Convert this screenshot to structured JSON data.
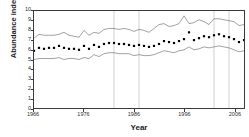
{
  "chart_data": {
    "type": "line",
    "title": "",
    "subtitle": "",
    "xlabel": "Year",
    "ylabel": "Abundance index",
    "xlim": [
      1966,
      2008
    ],
    "ylim": [
      0,
      10
    ],
    "grid": "vertical-only",
    "legend": "none",
    "xticks": [
      1966,
      1976,
      1986,
      1996,
      2006
    ],
    "xtick_labels": [
      "1966",
      "1976",
      "1986",
      "1996",
      "2006"
    ],
    "yticks": [
      0,
      1,
      2,
      3,
      4,
      5,
      6,
      7,
      8,
      9,
      10
    ],
    "ytick_labels": [
      "0",
      "1",
      "2",
      "3",
      "4",
      "5",
      "6",
      "7",
      "8",
      "9",
      "10"
    ],
    "gridline_years": [
      1982,
      1987,
      2002,
      2005
    ],
    "x": [
      1966,
      1967,
      1968,
      1969,
      1970,
      1971,
      1972,
      1973,
      1974,
      1975,
      1976,
      1977,
      1978,
      1979,
      1980,
      1981,
      1982,
      1983,
      1984,
      1985,
      1986,
      1987,
      1988,
      1989,
      1990,
      1991,
      1992,
      1993,
      1994,
      1995,
      1996,
      1997,
      1998,
      1999,
      2000,
      2001,
      2002,
      2003,
      2004,
      2005,
      2006,
      2007,
      2008
    ],
    "series": [
      {
        "name": "Abundance index",
        "style": "markers",
        "marker": "square",
        "color": "#000000",
        "values": [
          5.9,
          6.2,
          6.1,
          6.2,
          6.2,
          6.4,
          6.2,
          6.1,
          6.1,
          6.0,
          6.4,
          6.1,
          6.5,
          6.3,
          6.6,
          6.7,
          6.7,
          6.6,
          6.6,
          6.5,
          6.4,
          6.5,
          6.4,
          6.3,
          6.4,
          6.6,
          6.9,
          6.8,
          6.7,
          6.9,
          7.1,
          7.8,
          7.0,
          7.2,
          7.4,
          7.3,
          7.5,
          7.6,
          7.4,
          7.3,
          7.1,
          6.8,
          7.0
        ]
      },
      {
        "name": "Upper confidence bound",
        "style": "line",
        "color": "#555555",
        "values": [
          7.2,
          7.6,
          7.5,
          7.5,
          7.5,
          7.6,
          7.8,
          7.5,
          7.4,
          7.3,
          8.0,
          7.5,
          7.8,
          7.7,
          8.1,
          8.2,
          8.2,
          8.1,
          8.2,
          8.1,
          7.9,
          8.1,
          8.0,
          7.8,
          8.2,
          8.6,
          8.7,
          8.4,
          8.5,
          8.7,
          9.5,
          8.7,
          8.8,
          9.1,
          8.9,
          8.6,
          9.2,
          9.2,
          9.1,
          9.0,
          8.9,
          8.5,
          8.6
        ]
      },
      {
        "name": "Lower confidence bound",
        "style": "line",
        "color": "#555555",
        "values": [
          5.0,
          5.1,
          5.1,
          5.1,
          5.1,
          5.2,
          5.0,
          5.1,
          5.1,
          5.0,
          5.2,
          5.1,
          5.5,
          5.3,
          5.6,
          5.7,
          5.7,
          5.6,
          5.6,
          5.6,
          5.4,
          5.5,
          5.4,
          5.4,
          5.5,
          5.7,
          5.9,
          5.8,
          5.7,
          5.9,
          6.0,
          6.3,
          6.0,
          6.1,
          6.3,
          6.2,
          6.3,
          6.4,
          6.3,
          6.2,
          6.0,
          5.8,
          5.9
        ]
      }
    ]
  }
}
